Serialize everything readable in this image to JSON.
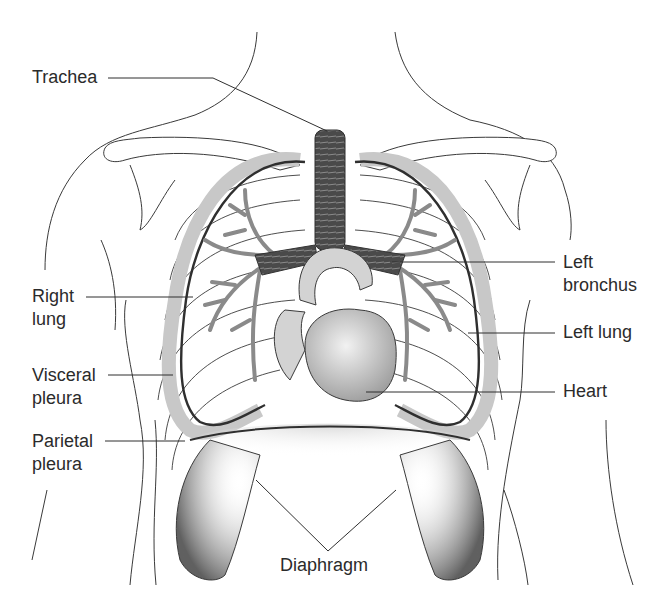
{
  "figure": {
    "style": "grayscale line illustration",
    "colors": {
      "background": "#ffffff",
      "outline": "#3a3a3a",
      "label_text": "#2b2b2b",
      "pleura_band": "#c8c8c8",
      "airway": "#555555",
      "bronchial_tree": "#8a8a8a",
      "heart": "#b9b9b9",
      "vessels": "#d3d3d3",
      "diaphragm_shade": "#6e6e6e"
    }
  },
  "labels": {
    "trachea": {
      "line1": "Trachea"
    },
    "right_lung": {
      "line1": "Right",
      "line2": "lung"
    },
    "visceral_pleura": {
      "line1": "Visceral",
      "line2": "pleura"
    },
    "parietal_pleura": {
      "line1": "Parietal",
      "line2": "pleura"
    },
    "left_bronchus": {
      "line1": "Left",
      "line2": "bronchus"
    },
    "left_lung": {
      "line1": "Left lung"
    },
    "heart": {
      "line1": "Heart"
    },
    "diaphragm": {
      "line1": "Diaphragm"
    }
  }
}
